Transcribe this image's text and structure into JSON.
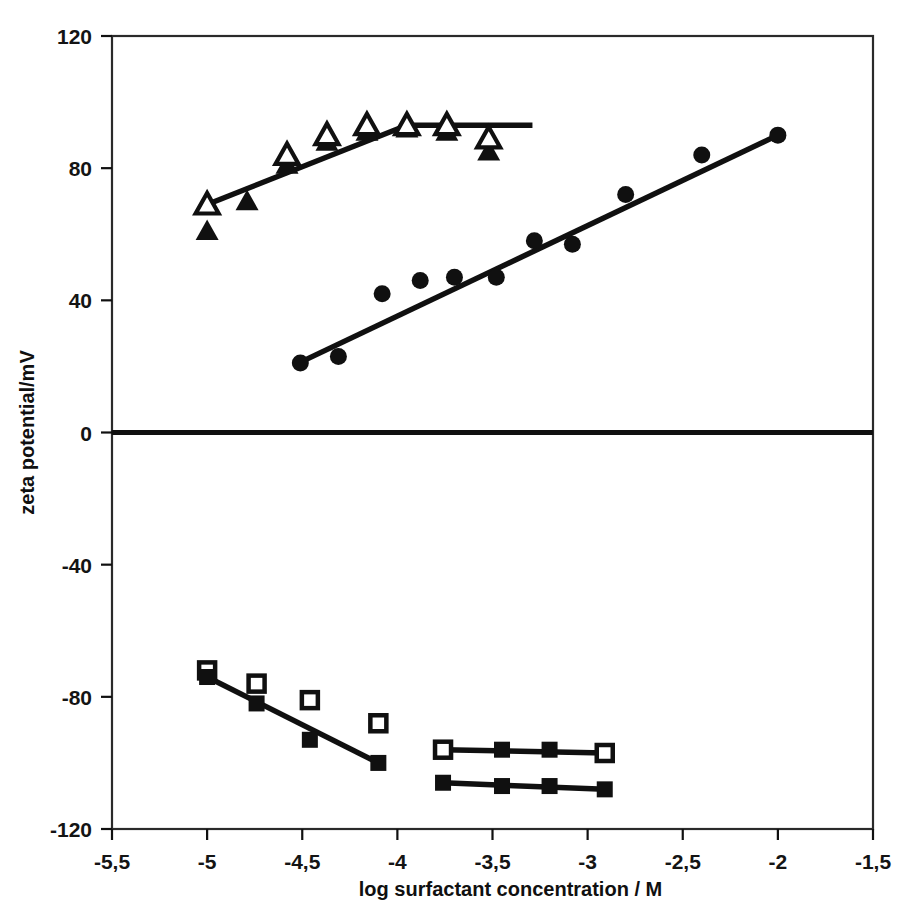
{
  "chart_data": {
    "type": "scatter",
    "title": "",
    "xlabel": "log surfactant concentration / M",
    "ylabel": "zeta potential/mV",
    "xlim": [
      -5.5,
      -1.5
    ],
    "ylim": [
      -120,
      120
    ],
    "xticks": [
      -5.5,
      -5,
      -4.5,
      -4,
      -3.5,
      -3,
      -2.5,
      -2,
      -1.5
    ],
    "xtick_labels": [
      "-5,5",
      "-5",
      "-4,5",
      "-4",
      "-3,5",
      "-3",
      "-2,5",
      "-2",
      "-1,5"
    ],
    "yticks": [
      120,
      80,
      40,
      0,
      -40,
      -80,
      -120
    ],
    "ytick_labels": [
      "120",
      "80",
      "40",
      "0",
      "-40",
      "-80",
      "-120"
    ],
    "grid": false,
    "legend": "none",
    "zero_line": {
      "y": 0,
      "style": "thick-solid"
    },
    "series": [
      {
        "name": "filled-triangle",
        "marker": "triangle-filled",
        "points": [
          {
            "x": -5.0,
            "y": 61
          },
          {
            "x": -4.79,
            "y": 70
          },
          {
            "x": -4.58,
            "y": 81
          },
          {
            "x": -4.37,
            "y": 88
          },
          {
            "x": -4.16,
            "y": 91
          },
          {
            "x": -3.95,
            "y": 92
          },
          {
            "x": -3.74,
            "y": 91
          },
          {
            "x": -3.52,
            "y": 85
          }
        ]
      },
      {
        "name": "open-triangle",
        "marker": "triangle-open",
        "points": [
          {
            "x": -5.0,
            "y": 69
          },
          {
            "x": -4.58,
            "y": 84
          },
          {
            "x": -4.37,
            "y": 90
          },
          {
            "x": -4.16,
            "y": 93
          },
          {
            "x": -3.95,
            "y": 93
          },
          {
            "x": -3.74,
            "y": 93
          },
          {
            "x": -3.52,
            "y": 89
          }
        ]
      },
      {
        "name": "filled-circle",
        "marker": "circle-filled",
        "points": [
          {
            "x": -4.51,
            "y": 21
          },
          {
            "x": -4.31,
            "y": 23
          },
          {
            "x": -4.08,
            "y": 42
          },
          {
            "x": -3.88,
            "y": 46
          },
          {
            "x": -3.7,
            "y": 47
          },
          {
            "x": -3.48,
            "y": 47
          },
          {
            "x": -3.28,
            "y": 58
          },
          {
            "x": -3.08,
            "y": 57
          },
          {
            "x": -2.8,
            "y": 72
          },
          {
            "x": -2.4,
            "y": 84
          },
          {
            "x": -2.0,
            "y": 90
          }
        ]
      },
      {
        "name": "open-square-descending",
        "marker": "square-open",
        "points": [
          {
            "x": -5.0,
            "y": -72
          },
          {
            "x": -4.74,
            "y": -76
          },
          {
            "x": -4.46,
            "y": -81
          },
          {
            "x": -4.1,
            "y": -88
          }
        ]
      },
      {
        "name": "filled-square-descending",
        "marker": "square-filled",
        "points": [
          {
            "x": -5.0,
            "y": -74
          },
          {
            "x": -4.74,
            "y": -82
          },
          {
            "x": -4.46,
            "y": -93
          },
          {
            "x": -4.1,
            "y": -100
          }
        ]
      },
      {
        "name": "open-square-plateau",
        "marker": "square-open",
        "points": [
          {
            "x": -3.76,
            "y": -96
          },
          {
            "x": -2.91,
            "y": -97
          }
        ]
      },
      {
        "name": "filled-square-plateau-upper",
        "marker": "square-filled",
        "points": [
          {
            "x": -3.45,
            "y": -96
          },
          {
            "x": -3.2,
            "y": -96
          }
        ]
      },
      {
        "name": "filled-square-plateau-lower",
        "marker": "square-filled",
        "points": [
          {
            "x": -3.76,
            "y": -106
          },
          {
            "x": -3.45,
            "y": -107
          },
          {
            "x": -3.2,
            "y": -107
          },
          {
            "x": -2.91,
            "y": -108
          }
        ]
      }
    ],
    "fit_lines": [
      {
        "name": "triangle-rise-line",
        "x1": -5.0,
        "y1": 69,
        "x2": -3.95,
        "y2": 93
      },
      {
        "name": "triangle-plateau-line",
        "x1": -3.95,
        "y1": 93,
        "x2": -3.29,
        "y2": 93
      },
      {
        "name": "circle-trend-line",
        "x1": -4.52,
        "y1": 21,
        "x2": -2.0,
        "y2": 90
      },
      {
        "name": "square-descending-line",
        "x1": -5.0,
        "y1": -74,
        "x2": -4.1,
        "y2": -100
      },
      {
        "name": "square-plateau-upper-line",
        "x1": -3.76,
        "y1": -96,
        "x2": -2.91,
        "y2": -97
      },
      {
        "name": "square-plateau-lower-line",
        "x1": -3.76,
        "y1": -106,
        "x2": -2.91,
        "y2": -108
      }
    ],
    "colors": {
      "ink": "#101010",
      "background": "#ffffff",
      "frame": "#2a2a2a"
    }
  }
}
